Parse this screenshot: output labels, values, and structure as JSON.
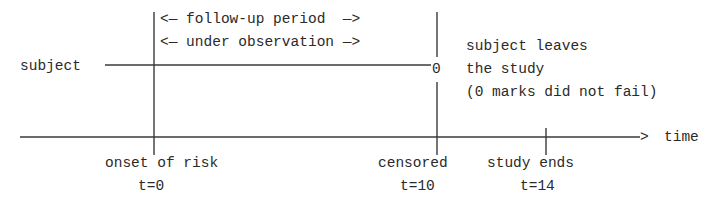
{
  "diagram": {
    "type": "survival-analysis censoring timeline",
    "colors": {
      "line": "#3a3a3a",
      "text": "#2a2a2a",
      "background": "#ffffff"
    },
    "row_label": "subject",
    "period_labels": {
      "follow_up": "<— follow-up period  —>",
      "observation": "<— under observation —>"
    },
    "censor_marker": "0",
    "censor_note": [
      "subject leaves",
      "the study",
      "(0 marks did not fail)"
    ],
    "axis": {
      "label": "time",
      "arrow": ">"
    },
    "ticks": [
      {
        "name": "onset of risk",
        "t_label": "t=0",
        "t": 0
      },
      {
        "name": "censored",
        "t_label": "t=10",
        "t": 10
      },
      {
        "name": "study ends",
        "t_label": "t=14",
        "t": 14
      }
    ]
  }
}
